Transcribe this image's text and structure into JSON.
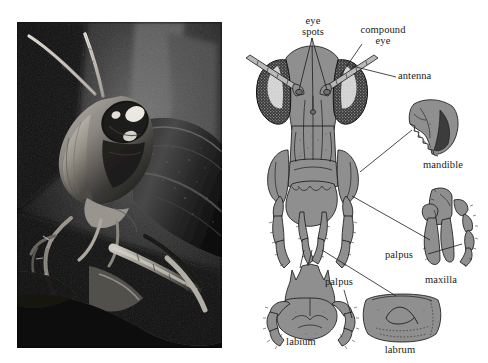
{
  "figure": {
    "background_color": "#ffffff",
    "panels": [
      {
        "id": "photograph",
        "kind": "photograph",
        "subject": "grasshopper head and thorax close-up",
        "palette": "black-and-white"
      },
      {
        "id": "diagram",
        "kind": "line-drawing",
        "subject": "anterior view of grasshopper head with detached mouthparts"
      }
    ]
  },
  "photo": {
    "alt": "Black and white close-up photograph of a grasshopper, head in profile facing left, long antennae sweeping up and to the left, pale compound eye with dark stripe, textured pronotum on the right, forelegs and a twig at lower left.",
    "frame_color": "#0a0a0a",
    "highlight_color": "#e9e7e2"
  },
  "diagram": {
    "fill_color": "#8f8f8f",
    "stroke_color": "#1b1b1b",
    "eye_fill_color": "#3a3a3a",
    "labels": [
      {
        "id": "eye-spots",
        "line1": "eye",
        "line2": "spots",
        "x": 313,
        "y": 22
      },
      {
        "id": "compound-eye",
        "line1": "compound",
        "line2": "eye",
        "x": 383,
        "y": 31
      },
      {
        "id": "antenna",
        "line1": "antenna",
        "line2": "",
        "x": 424,
        "y": 77
      },
      {
        "id": "mandible",
        "line1": "mandible",
        "line2": "",
        "x": 443,
        "y": 166
      },
      {
        "id": "maxilla-palpus",
        "line1": "palpus",
        "line2": "",
        "x": 403,
        "y": 256
      },
      {
        "id": "maxilla",
        "line1": "maxilla",
        "line2": "",
        "x": 441,
        "y": 281
      },
      {
        "id": "labium-palpus",
        "line1": "palpus",
        "line2": "",
        "x": 349,
        "y": 283
      },
      {
        "id": "labium",
        "line1": "labium",
        "line2": "",
        "x": 301,
        "y": 343
      },
      {
        "id": "labrum",
        "line1": "labrum",
        "line2": "",
        "x": 400,
        "y": 351
      }
    ],
    "parts": [
      {
        "id": "head-capsule",
        "name": "head capsule, anterior view"
      },
      {
        "id": "compound-eye-left",
        "name": "left compound eye"
      },
      {
        "id": "compound-eye-right",
        "name": "right compound eye"
      },
      {
        "id": "antenna-left",
        "name": "left antenna"
      },
      {
        "id": "antenna-right",
        "name": "right antenna"
      },
      {
        "id": "ocellus-left",
        "name": "left eye spot (ocellus)"
      },
      {
        "id": "ocellus-right",
        "name": "right eye spot (ocellus)"
      },
      {
        "id": "mandible-detail",
        "name": "isolated mandible with serrated teeth"
      },
      {
        "id": "maxilla-detail",
        "name": "isolated maxilla with segmented palpus"
      },
      {
        "id": "labium-detail",
        "name": "isolated labium with two palps"
      },
      {
        "id": "labrum-detail",
        "name": "isolated labrum"
      }
    ]
  }
}
